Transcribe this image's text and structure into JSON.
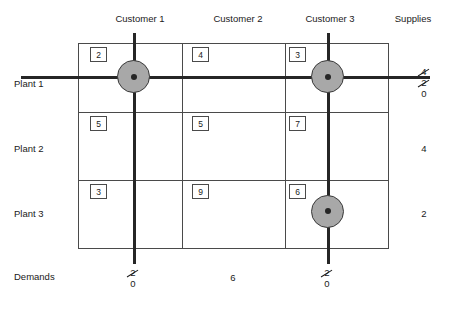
{
  "diagram": {
    "columns": [
      {
        "label": "Customer 1"
      },
      {
        "label": "Customer 2"
      },
      {
        "label": "Customer 3"
      }
    ],
    "supplies_header": "Supplies",
    "demands_label": "Demands",
    "rows": [
      {
        "label": "Plant 1"
      },
      {
        "label": "Plant 2"
      },
      {
        "label": "Plant 3"
      }
    ],
    "costs": [
      [
        "2",
        "4",
        "3"
      ],
      [
        "5",
        "5",
        "7"
      ],
      [
        "3",
        "9",
        "6"
      ]
    ],
    "supplies": [
      {
        "crossed": [
          "4",
          "2"
        ],
        "current": "0"
      },
      {
        "crossed": [],
        "current": "4"
      },
      {
        "crossed": [],
        "current": "2"
      }
    ],
    "demands": [
      {
        "crossed": [
          "2"
        ],
        "current": "0"
      },
      {
        "crossed": [],
        "current": "6"
      },
      {
        "crossed": [
          "2"
        ],
        "current": "0"
      }
    ],
    "allocations": [
      {
        "row": "Plant 1",
        "column": "Customer 1"
      },
      {
        "row": "Plant 1",
        "column": "Customer 3"
      },
      {
        "row": "Plant 3",
        "column": "Customer 3"
      }
    ],
    "colors": {
      "circle_fill": "#a8a8a8",
      "circle_stroke": "#3a3a3a",
      "grid": "#4a4a4a",
      "heavy_line": "#262626",
      "text": "#1a1a1a"
    }
  }
}
